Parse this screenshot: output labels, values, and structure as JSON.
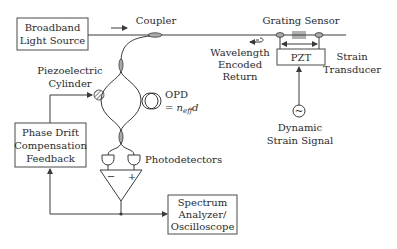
{
  "diagram": {
    "blocks": {
      "light_source": [
        "Broadband",
        "Light Source"
      ],
      "phase_drift": [
        "Phase Drift",
        "Compensation",
        "Feedback"
      ],
      "spectrum_analyzer": [
        "Spectrum",
        "Analyzer/",
        "Oscilloscope"
      ],
      "pzt": "PZT"
    },
    "labels": {
      "coupler": "Coupler",
      "grating_sensor": "Grating Sensor",
      "wavelength_return": [
        "Wavelength",
        "Encoded",
        "Return"
      ],
      "strain_transducer": [
        "Strain",
        "Transducer"
      ],
      "piezo_cylinder": [
        "Piezoelectric",
        "Cylinder"
      ],
      "opd": "OPD",
      "opd_eq_prefix": "= n",
      "opd_eq_sub": "eff",
      "opd_eq_suffix": "d",
      "photodetectors": "Photodetectors",
      "dynamic_signal": [
        "Dynamic",
        "Strain Signal"
      ],
      "minus": "−",
      "plus": "+",
      "sine": "~"
    },
    "colors": {
      "line": "#3a3a3a",
      "coupler_fill": "#a9a9a9",
      "background": "#ffffff"
    }
  }
}
